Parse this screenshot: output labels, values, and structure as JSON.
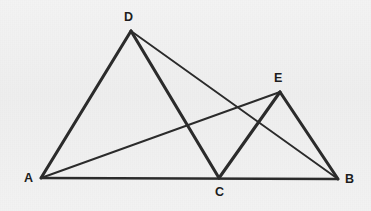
{
  "figure": {
    "background_color": "#f1f1f1",
    "stroke_color": "#2b2b2b",
    "points": {
      "A": {
        "label": "A",
        "x": 41,
        "y": 178,
        "label_x": 24,
        "label_y": 172
      },
      "B": {
        "label": "B",
        "x": 338,
        "y": 179,
        "label_x": 345,
        "label_y": 173
      },
      "C": {
        "label": "C",
        "x": 219,
        "y": 178,
        "label_x": 215,
        "label_y": 186
      },
      "D": {
        "label": "D",
        "x": 131,
        "y": 31,
        "label_x": 124,
        "label_y": 11
      },
      "E": {
        "label": "E",
        "x": 280,
        "y": 92,
        "label_x": 274,
        "label_y": 72
      }
    },
    "segments": [
      {
        "name": "segment-AB",
        "from": "A",
        "to": "B",
        "weight": "med"
      },
      {
        "name": "segment-AD",
        "from": "A",
        "to": "D",
        "weight": "thick"
      },
      {
        "name": "segment-DC",
        "from": "D",
        "to": "C",
        "weight": "thick"
      },
      {
        "name": "segment-CE",
        "from": "C",
        "to": "E",
        "weight": "thick"
      },
      {
        "name": "segment-EB",
        "from": "E",
        "to": "B",
        "weight": "thick"
      },
      {
        "name": "segment-AE",
        "from": "A",
        "to": "E",
        "weight": "thin"
      },
      {
        "name": "segment-DB",
        "from": "D",
        "to": "B",
        "weight": "thin"
      }
    ]
  }
}
